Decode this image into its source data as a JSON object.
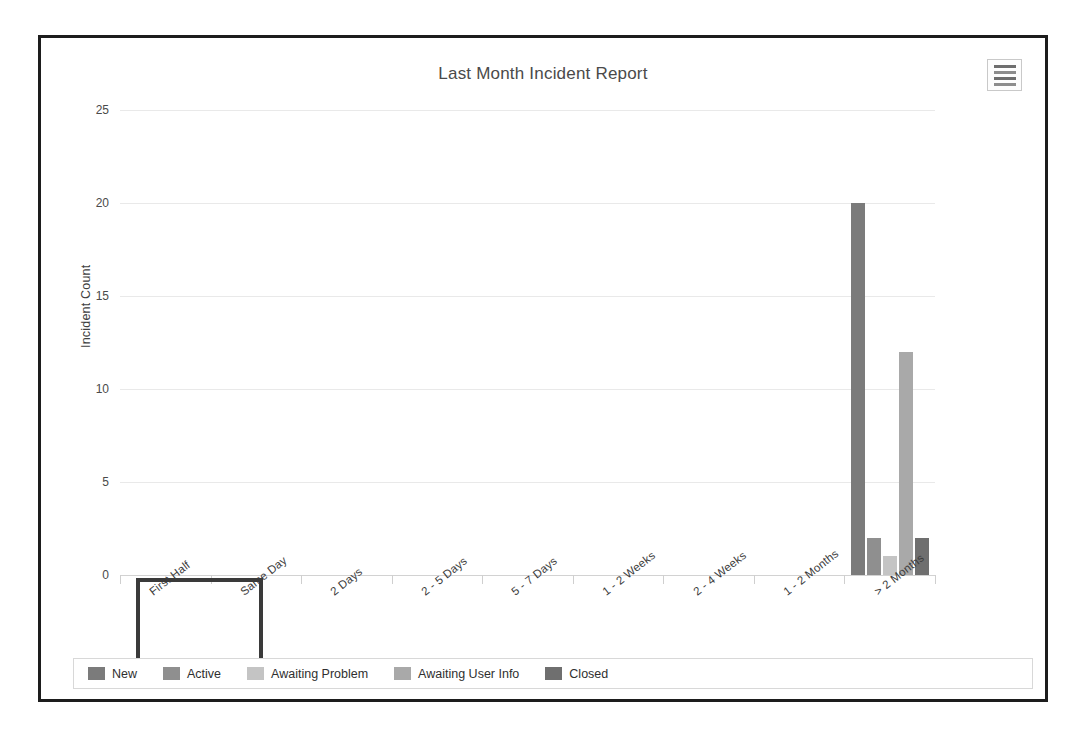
{
  "panel": {
    "menu_button_icon": "menu-lines-icon"
  },
  "chart_data": {
    "type": "bar",
    "title": "Last Month Incident Report",
    "xlabel": "",
    "ylabel": "Incident Count",
    "ylim": [
      0,
      25
    ],
    "yticks": [
      0,
      5,
      10,
      15,
      20,
      25
    ],
    "grid": true,
    "legend_position": "bottom",
    "categories": [
      "First Half",
      "Same Day",
      "2 Days",
      "2 - 5 Days",
      "5 - 7 Days",
      "1 - 2 Weeks",
      "2 - 4 Weeks",
      "1 - 2 Months",
      "> 2 Months"
    ],
    "series": [
      {
        "name": "New",
        "color": "#7b7b7b",
        "values": [
          0,
          0,
          0,
          0,
          0,
          0,
          0,
          0,
          20
        ]
      },
      {
        "name": "Active",
        "color": "#8f8f8f",
        "values": [
          0,
          0,
          0,
          0,
          0,
          0,
          0,
          0,
          2
        ]
      },
      {
        "name": "Awaiting Problem",
        "color": "#c4c4c4",
        "values": [
          0,
          0,
          0,
          0,
          0,
          0,
          0,
          0,
          1
        ]
      },
      {
        "name": "Awaiting User Info",
        "color": "#a9a9a9",
        "values": [
          0,
          0,
          0,
          0,
          0,
          0,
          0,
          0,
          12
        ]
      },
      {
        "name": "Closed",
        "color": "#6f6f6f",
        "values": [
          0,
          0,
          0,
          0,
          0,
          0,
          0,
          0,
          2
        ]
      }
    ]
  },
  "selection": {
    "highlighted_category": "First Half"
  }
}
